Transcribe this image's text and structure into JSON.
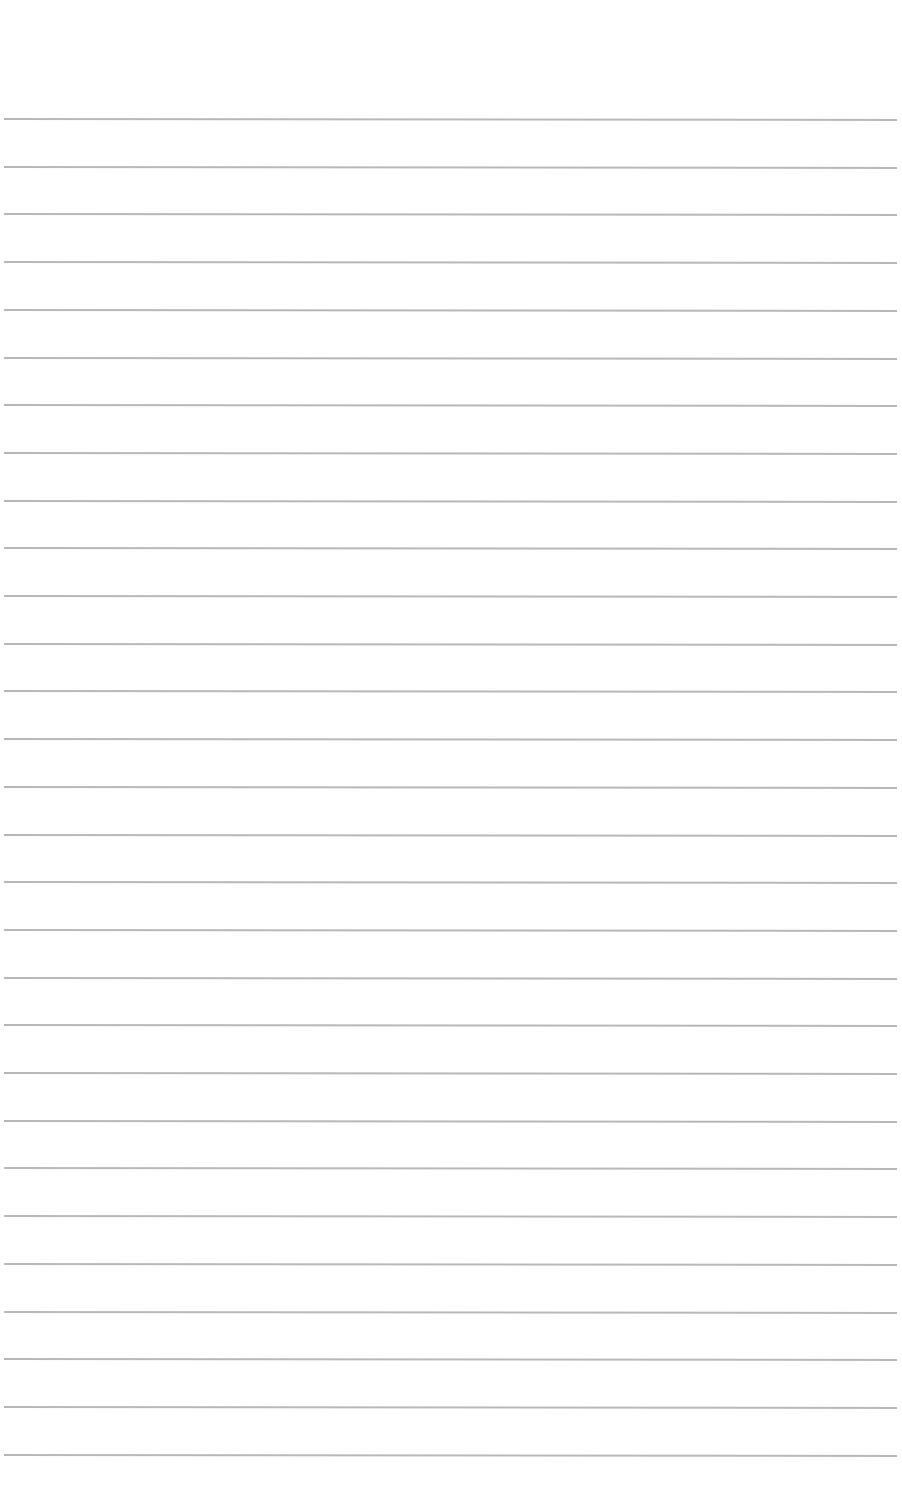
{
  "page": {
    "type": "ruled-paper",
    "background_color": "#ffffff",
    "rule_color": "#a8a8a8",
    "rule_count": 29,
    "first_rule_y": 118,
    "rule_spacing": 47.7,
    "rule_left_x": 4,
    "rule_right_x": 897,
    "text_content": []
  }
}
